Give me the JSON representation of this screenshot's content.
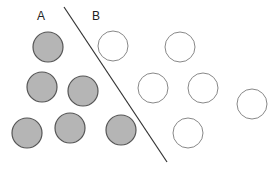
{
  "labels": {
    "a": "A",
    "b": "B"
  },
  "colors": {
    "filled": "#b5b5b5",
    "stroke": "#555555",
    "hollow_stroke": "#888888",
    "line": "#333333"
  },
  "groups": {
    "A": {
      "style": "filled",
      "circles": [
        [
          48,
          47
        ],
        [
          42,
          87
        ],
        [
          83,
          91
        ],
        [
          27,
          133
        ],
        [
          70,
          128
        ],
        [
          121,
          130
        ]
      ]
    },
    "B": {
      "style": "hollow",
      "circles": [
        [
          113,
          46
        ],
        [
          180,
          47
        ],
        [
          153,
          88
        ],
        [
          203,
          88
        ],
        [
          252,
          104
        ],
        [
          188,
          133
        ]
      ]
    }
  },
  "divider": {
    "x1": 64,
    "y1": 7,
    "x2": 167,
    "y2": 162
  },
  "caption": ""
}
